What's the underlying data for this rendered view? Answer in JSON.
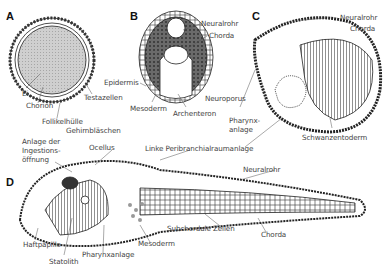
{
  "panels": {
    "A": {
      "letter": "A",
      "labels": {
        "ei": "Ei",
        "chorion": "Chorion",
        "testazellen": "Testazellen",
        "follikelhuelle": "Follikelhülle"
      }
    },
    "B": {
      "letter": "B",
      "labels": {
        "neuralrohr": "Neuralrohr",
        "chorda": "Chorda",
        "epidermis": "Epidermis",
        "mesoderm": "Mesoderm",
        "archenteron": "Archenteron"
      }
    },
    "C": {
      "letter": "C",
      "labels": {
        "neuralrohr": "Neuralrohr",
        "chorda": "Chorda",
        "neuroporus": "Neuroporus",
        "pharynx_line1": "Pharynx-",
        "pharynx_line2": "anlage",
        "schwanzentoderm": "Schwanzentoderm"
      }
    },
    "D": {
      "letter": "D",
      "labels": {
        "gehirnblaeschen": "Gehirnbläschen",
        "anlage_line1": "Anlage der",
        "anlage_line2": "Ingestions-",
        "anlage_line3": "öffnung",
        "ocellus": "Ocellus",
        "peribranchial": "Linke Peribranchialraumanlage",
        "neuralrohr": "Neuralrohr",
        "haftpapille": "Haftpapille",
        "statolith": "Statolith",
        "pharynxanlage": "Pharynxanlage",
        "mesoderm": "Mesoderm",
        "subchordale": "Subchordale Zellen",
        "chorda": "Chorda"
      }
    }
  },
  "colors": {
    "ink": "#222222",
    "label": "#444444",
    "fill_light": "#d0d0d0",
    "fill_dark": "#555555"
  }
}
